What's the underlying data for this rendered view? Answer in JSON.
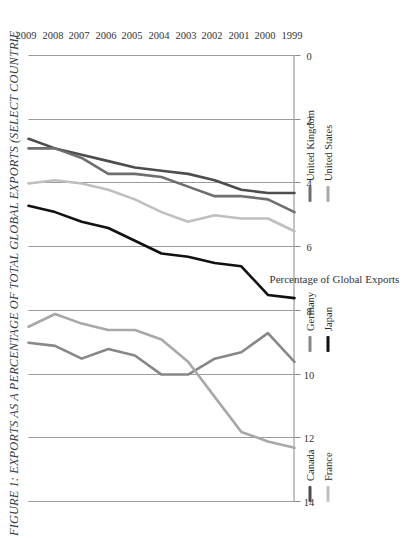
{
  "figure": {
    "title": "FIGURE 1: EXPORTS AS A PERCENTAGE OF TOTAL GLOBAL EXPORTS (SELECT COUNTRIE"
  },
  "chart_data": {
    "type": "line",
    "title": "FIGURE 1: EXPORTS AS A PERCENTAGE OF TOTAL GLOBAL EXPORTS (SELECT COUNTRIE",
    "xlabel": "",
    "ylabel": "Percentage of Global Exports",
    "x": [
      1999,
      2000,
      2001,
      2002,
      2003,
      2004,
      2005,
      2006,
      2007,
      2008,
      2009
    ],
    "xtick_labels": [
      "1999",
      "2000",
      "2001",
      "2002",
      "2003",
      "2004",
      "2005",
      "2006",
      "2007",
      "2008",
      "2009"
    ],
    "ylim": [
      0,
      14
    ],
    "ytick_labels": [
      "14",
      "12",
      "10",
      "8",
      "6",
      "4",
      "2",
      "0"
    ],
    "yticks": [
      14,
      12,
      10,
      8,
      6,
      4,
      2,
      0
    ],
    "grid": true,
    "legend_position": "bottom",
    "orientation": "rotated-90-ccw",
    "series": [
      {
        "name": "Canada",
        "color": "#4d4d4d",
        "values": [
          4.3,
          4.3,
          4.2,
          3.9,
          3.7,
          3.6,
          3.5,
          3.3,
          3.1,
          2.9,
          2.6
        ]
      },
      {
        "name": "France",
        "color": "#bfbfbf",
        "values": [
          5.5,
          5.1,
          5.1,
          5.0,
          5.2,
          4.9,
          4.5,
          4.2,
          4.0,
          3.9,
          4.0
        ]
      },
      {
        "name": "Germany",
        "color": "#878787",
        "values": [
          9.6,
          8.7,
          9.3,
          9.5,
          10.0,
          10.0,
          9.4,
          9.2,
          9.5,
          9.1,
          9.0
        ]
      },
      {
        "name": "Japan",
        "color": "#111111",
        "values": [
          7.6,
          7.5,
          6.6,
          6.5,
          6.3,
          6.2,
          5.8,
          5.4,
          5.2,
          4.9,
          4.7
        ]
      },
      {
        "name": "United Kingdom",
        "color": "#6e6e6e",
        "values": [
          4.9,
          4.5,
          4.4,
          4.4,
          4.1,
          3.8,
          3.7,
          3.7,
          3.2,
          2.9,
          2.9
        ]
      },
      {
        "name": "United States",
        "color": "#a8a8a8",
        "values": [
          12.3,
          12.1,
          11.8,
          10.7,
          9.6,
          8.9,
          8.6,
          8.6,
          8.4,
          8.1,
          8.5
        ]
      }
    ]
  },
  "axes": {
    "value_axis_title": "Percentage of Global Exports",
    "value_ticks": [
      "14",
      "12",
      "10",
      "8",
      "6",
      "4",
      "2",
      "0"
    ],
    "year_ticks": [
      "1999",
      "2000",
      "2001",
      "2002",
      "2003",
      "2004",
      "2005",
      "2006",
      "2007",
      "2008",
      "2009"
    ]
  },
  "legend": {
    "items": [
      {
        "label": "Canada",
        "color": "#4d4d4d"
      },
      {
        "label": "France",
        "color": "#bfbfbf"
      },
      {
        "label": "Germany",
        "color": "#878787"
      },
      {
        "label": "Japan",
        "color": "#111111"
      },
      {
        "label": "United Kingdom",
        "color": "#6e6e6e"
      },
      {
        "label": "United States",
        "color": "#a8a8a8"
      }
    ]
  }
}
